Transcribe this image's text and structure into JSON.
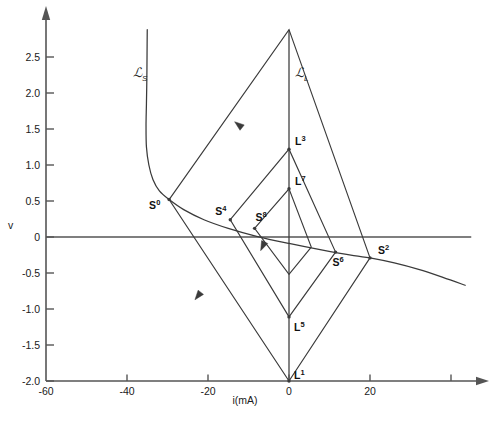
{
  "figure": {
    "background": "#ffffff",
    "stroke": "#3a3a3a",
    "axis_color": "#555555"
  },
  "axes": {
    "x_label": "i(mA)",
    "y_label": "v",
    "x_ticks": [
      "-60",
      "-40",
      "-20",
      "0",
      "20"
    ],
    "x_tick_values": [
      -60,
      -40,
      -20,
      0,
      20
    ],
    "x_extra_tick_value": 40,
    "y_ticks": [
      "2.5",
      "2.0",
      "1.5",
      "1.0",
      "0.5",
      "0",
      "-0.5",
      "-1.0",
      "-1.5",
      "-2.0"
    ],
    "y_tick_values": [
      2.5,
      2.0,
      1.5,
      1.0,
      0.5,
      0,
      -0.5,
      -1.0,
      -1.5,
      -2.0
    ],
    "xlim": [
      -60,
      48
    ],
    "ylim": [
      -2.0,
      2.9
    ]
  },
  "chart_data": {
    "type": "line",
    "title": "",
    "xlabel": "i(mA)",
    "ylabel": "v",
    "xlim": [
      -60,
      48
    ],
    "ylim": [
      -2.0,
      2.9
    ],
    "grid": false,
    "legend": "none",
    "series": [
      {
        "name": "script-L-S",
        "label": "ℒ",
        "sublabel": "S",
        "label_point": [
          -38.5,
          2.22
        ],
        "kind": "n-shaped-driving-point-curve",
        "points": [
          [
            -35.0,
            2.88
          ],
          [
            -35.05,
            2.55
          ],
          [
            -35.1,
            2.2
          ],
          [
            -35.2,
            1.85
          ],
          [
            -35.3,
            1.55
          ],
          [
            -35.2,
            1.25
          ],
          [
            -34.6,
            1.0
          ],
          [
            -33.6,
            0.8
          ],
          [
            -32.0,
            0.64
          ],
          [
            -29.6,
            0.52
          ],
          [
            -26.0,
            0.38
          ],
          [
            -21.0,
            0.24
          ],
          [
            -15.0,
            0.12
          ],
          [
            -8.0,
            0.01
          ],
          [
            0.0,
            -0.09
          ],
          [
            8.0,
            -0.18
          ],
          [
            16.0,
            -0.26
          ],
          [
            20.0,
            -0.29
          ],
          [
            26.0,
            -0.36
          ],
          [
            32.0,
            -0.45
          ],
          [
            38.0,
            -0.56
          ],
          [
            43.5,
            -0.67
          ]
        ]
      },
      {
        "name": "script-L-L",
        "label": "ℒ",
        "sublabel": "L",
        "label_point": [
          1.5,
          2.22
        ],
        "kind": "vertical-load-line",
        "points": [
          [
            0.0,
            2.88
          ],
          [
            0.0,
            -2.0
          ]
        ]
      },
      {
        "name": "outer-route",
        "kind": "closed-trajectory",
        "points": [
          [
            -29.6,
            0.52
          ],
          [
            0.0,
            2.88
          ],
          [
            20.0,
            -0.29
          ],
          [
            0.0,
            -2.0
          ],
          [
            -29.6,
            0.52
          ]
        ]
      },
      {
        "name": "middle-route",
        "kind": "closed-trajectory",
        "points": [
          [
            -14.5,
            0.24
          ],
          [
            0.0,
            1.22
          ],
          [
            11.5,
            -0.21
          ],
          [
            0.0,
            -1.11
          ],
          [
            -14.5,
            0.24
          ]
        ]
      },
      {
        "name": "inner-route",
        "kind": "closed-trajectory",
        "points": [
          [
            -8.5,
            0.12
          ],
          [
            0.0,
            0.67
          ],
          [
            5.5,
            -0.14
          ],
          [
            0.0,
            -0.52
          ],
          [
            -8.5,
            0.12
          ]
        ]
      },
      {
        "name": "zero-axis-line",
        "kind": "horizontal-axis-line",
        "points": [
          [
            -60.0,
            0.0
          ],
          [
            45.0,
            0.0
          ]
        ]
      }
    ],
    "annotations": [
      {
        "name": "S0",
        "letter": "S",
        "sup": "0",
        "x": -29.6,
        "v": 0.52,
        "label_dx": -20,
        "label_dy": 9
      },
      {
        "name": "S4",
        "letter": "S",
        "sup": "4",
        "x": -14.5,
        "v": 0.24,
        "label_dx": -15,
        "label_dy": -5
      },
      {
        "name": "S8",
        "letter": "S",
        "sup": "8",
        "x": -8.5,
        "v": 0.12,
        "label_dx": 1,
        "label_dy": -7
      },
      {
        "name": "S6",
        "letter": "S",
        "sup": "6",
        "x": 11.5,
        "v": -0.21,
        "label_dx": -3,
        "label_dy": 14
      },
      {
        "name": "S2",
        "letter": "S",
        "sup": "2",
        "x": 20.0,
        "v": -0.29,
        "label_dx": 8,
        "label_dy": -4
      },
      {
        "name": "L3",
        "letter": "L",
        "sup": "3",
        "x": 0.0,
        "v": 1.22,
        "label_dx": 6,
        "label_dy": -4
      },
      {
        "name": "L7",
        "letter": "L",
        "sup": "7",
        "x": 0.0,
        "v": 0.67,
        "label_dx": 6,
        "label_dy": -4
      },
      {
        "name": "L5",
        "letter": "L",
        "sup": "5",
        "x": 0.0,
        "v": -1.11,
        "label_dx": 5,
        "label_dy": 14
      },
      {
        "name": "L1",
        "letter": "L",
        "sup": "1",
        "x": 0.0,
        "v": -2.0,
        "label_dx": 5,
        "label_dy": -2
      }
    ],
    "direction_arrows": [
      {
        "name": "arrow-upper-left-outer",
        "x": -12.5,
        "v": 1.56,
        "angle": 218
      },
      {
        "name": "arrow-lower-left-outer",
        "x": -22.5,
        "v": -0.82,
        "angle": 128
      },
      {
        "name": "arrow-inner-descend",
        "x": -6.5,
        "v": -0.13,
        "angle": 115
      }
    ]
  }
}
